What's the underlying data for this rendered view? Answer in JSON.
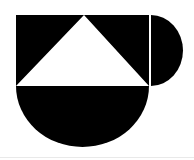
{
  "figure": {
    "title": "Abstract geometric composition",
    "background_color": "#ffffff",
    "ink_color": "#000000",
    "rule_color": "#e9e9e9",
    "canvas": {
      "width": 194,
      "height": 160
    },
    "shapes": [
      {
        "id": "square-with-triangle-notch",
        "name": "black square with white triangular notch",
        "type": "polygon-with-cutout",
        "fill": "#000000",
        "x": 16,
        "y": 15,
        "width": 133,
        "height": 71,
        "cutout": {
          "id": "triangle-notch",
          "name": "white isosceles triangle",
          "type": "triangle",
          "fill": "#ffffff",
          "apex": {
            "x": 84,
            "y": 15
          },
          "base_left": {
            "x": 16,
            "y": 86
          },
          "base_right": {
            "x": 149,
            "y": 86
          }
        }
      },
      {
        "id": "right-semicircle",
        "name": "black half disc opening left",
        "type": "semicircle",
        "fill": "#000000",
        "flat_edge": "left",
        "center": {
          "x": 151,
          "y": 50.5
        },
        "radius": 35.5,
        "x": 151,
        "y": 15,
        "width": 32,
        "height": 71
      },
      {
        "id": "bottom-semicircle",
        "name": "black half disc opening up",
        "type": "semicircle",
        "fill": "#000000",
        "flat_edge": "top",
        "center": {
          "x": 82.5,
          "y": 86
        },
        "radius": 66.5,
        "x": 16,
        "y": 86,
        "width": 133,
        "height": 61
      }
    ],
    "gaps": [
      {
        "id": "vertical-gap",
        "name": "white separator between square and right half disc",
        "x": 149,
        "y": 15,
        "width": 2,
        "height": 71,
        "fill": "#ffffff"
      },
      {
        "id": "horizontal-gap",
        "name": "white separator between square and bottom half disc",
        "x": 16,
        "y": 84,
        "width": 133,
        "height": 2,
        "fill": "#ffffff"
      }
    ],
    "bottom_rule": {
      "name": "faint bottom divider line",
      "y": 157,
      "color": "#e9e9e9"
    }
  }
}
